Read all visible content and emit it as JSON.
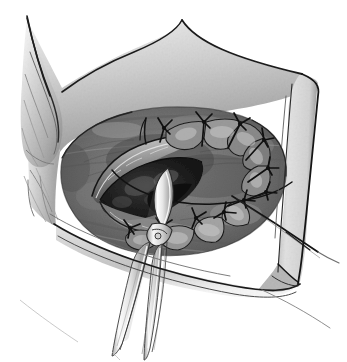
{
  "figure": {
    "title": "Surgical field illustration",
    "medium": "grayscale pen-and-ink wash drawing",
    "background_color": "#ffffff",
    "width": 347,
    "height": 362,
    "caption": "",
    "has_text_labels": false
  },
  "palette": {
    "background": "#ffffff",
    "ink_line": "#1a1a1a",
    "drape_light": "#e7e7e7",
    "drape_mid": "#c4c4c4",
    "tissue_light": "#b9b9b9",
    "tissue_mid": "#8d8d8d",
    "tissue_dark": "#5b5b5b",
    "cavity_dark": "#2e2e2e",
    "cavity_black": "#151515",
    "highlight": "#f4f4f4",
    "instrument_metal": "#efefef",
    "instrument_shadow": "#9a9a9a",
    "suture_thread": "#111111"
  },
  "elements": {
    "drape_upper_left_flap": {
      "name": "upper-left-tissue-flap",
      "description": "pointed retracted flap with layered folds in upper left",
      "tone": "#d9d9d9"
    },
    "drape_top_fold": {
      "name": "top-drape-fold",
      "description": "angular fold sweeping from upper left point to top right corner",
      "tone": "#cfcfcf"
    },
    "drape_right_band": {
      "name": "right-drape-band",
      "description": "vertical light band along right margin with dark contour edge",
      "tone": "#dcdcdc"
    },
    "drape_bottom_edge": {
      "name": "bottom-drape-edge",
      "description": "diagonal lower margin receding to lower left",
      "tone": "#d2d2d2"
    },
    "wound_field": {
      "name": "wound-field",
      "description": "central exposed tissue bed, mottled mid to dark grey",
      "tone": "#7d7d7d"
    },
    "incision_opening": {
      "name": "incision-opening",
      "description": "dark almond-shaped lumen left of centre",
      "tone": "#232323"
    },
    "sutured_margin_upper": {
      "name": "upper-suture-line",
      "description": "row of interrupted sutures along upper wound margin"
    },
    "sutured_margin_lower": {
      "name": "lower-suture-line",
      "description": "row of interrupted sutures along lower right wound margin"
    },
    "trailing_suture": {
      "name": "trailing-suture-thread",
      "description": "long thread running diagonally down and right past the drape edge"
    },
    "instrument": {
      "name": "surgical-forceps",
      "description": "long slender clamp entering from bottom centre, bright metal jaws, hinge joint, tip inside the wound",
      "tone": "#f0f0f0"
    }
  },
  "counts": {
    "upper_sutures": 6,
    "lower_sutures": 5,
    "instrument_shanks": 2
  }
}
